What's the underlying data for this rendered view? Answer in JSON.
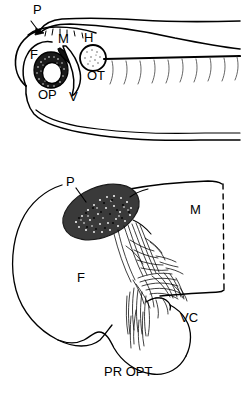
{
  "figure": {
    "background_color": "#ffffff",
    "ink_color": "#000000",
    "panel_count": 2
  },
  "panels": [
    {
      "id": "panel-top",
      "name": "whole-embryo-lateral-view",
      "description": "Lateral outline of embryo head and trunk with brain subdivisions and somite striations",
      "labels": [
        {
          "key": "P",
          "text": "P",
          "meaning": "pineal-organ",
          "x": 33,
          "y": 14
        },
        {
          "key": "M",
          "text": "M",
          "meaning": "midbrain",
          "x": 58,
          "y": 43
        },
        {
          "key": "H",
          "text": "H",
          "meaning": "hindbrain",
          "x": 84,
          "y": 42
        },
        {
          "key": "F",
          "text": "F",
          "meaning": "forebrain",
          "x": 30,
          "y": 59
        },
        {
          "key": "OP",
          "text": "OP",
          "meaning": "optic-primordium",
          "x": 38,
          "y": 99
        },
        {
          "key": "V",
          "text": "V",
          "meaning": "ventricle",
          "x": 69,
          "y": 101
        },
        {
          "key": "OT",
          "text": "OT",
          "meaning": "otic-vesicle",
          "x": 87,
          "y": 80
        }
      ]
    },
    {
      "id": "panel-bottom",
      "name": "forebrain-enlarged-view",
      "description": "Enlarged drawing of forebrain with stippled pineal organ and traced axon fiber tracts",
      "labels": [
        {
          "key": "P",
          "text": "P",
          "meaning": "pineal-organ",
          "x": 71,
          "y": 32
        },
        {
          "key": "M",
          "text": "M",
          "meaning": "midbrain",
          "x": 190,
          "y": 60
        },
        {
          "key": "F",
          "text": "F",
          "meaning": "forebrain",
          "x": 80,
          "y": 128
        },
        {
          "key": "VC",
          "text": "VC",
          "meaning": "ventral-commissure",
          "x": 184,
          "y": 163
        },
        {
          "key": "PR OPT",
          "text": "PR OPT",
          "meaning": "preoptic-nerve-tract",
          "x": 108,
          "y": 222
        }
      ]
    }
  ],
  "structures": {
    "pineal_fill": "stipple-dark",
    "optic_fill": "stipple-dark",
    "otic_fill": "stipple-light",
    "midbrain_boundary": "dashed-line",
    "fiber_tracts": "fine-traced-axons"
  }
}
